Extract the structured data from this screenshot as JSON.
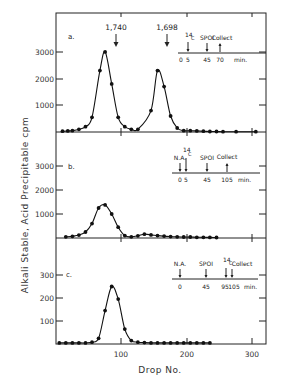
{
  "chart_data": [
    {
      "type": "line",
      "panel": "a.",
      "xlabel": "Drop No.",
      "ylabel": "Alkali Stable, Acid Precipitable cpm",
      "xlim": [
        0,
        320
      ],
      "ylim": [
        0,
        4000
      ],
      "yticks": [
        1000,
        2000,
        3000
      ],
      "xticks": [
        100,
        200,
        300
      ],
      "peak_labels": [
        {
          "x": 75,
          "label": "1,740"
        },
        {
          "x": 155,
          "label": "1,698"
        }
      ],
      "timeline": {
        "events": [
          {
            "t": 5,
            "label": "14C"
          },
          {
            "t": 45,
            "label": "SPOI"
          },
          {
            "t": 70,
            "label": "Collect"
          }
        ],
        "ticks": [
          "0",
          "5",
          "45",
          "70"
        ],
        "unit": "min."
      },
      "x": [
        10,
        18,
        25,
        35,
        45,
        55,
        67,
        75,
        85,
        95,
        105,
        115,
        125,
        145,
        155,
        165,
        175,
        185,
        195,
        205,
        215,
        225,
        235,
        245,
        255,
        275,
        305
      ],
      "values": [
        30,
        40,
        50,
        100,
        200,
        550,
        2300,
        3000,
        1800,
        550,
        200,
        100,
        100,
        800,
        2300,
        1700,
        600,
        150,
        50,
        50,
        40,
        30,
        20,
        20,
        10,
        10,
        10
      ]
    },
    {
      "type": "line",
      "panel": "b.",
      "xlim": [
        0,
        320
      ],
      "ylim": [
        0,
        4000
      ],
      "yticks": [
        1000,
        2000,
        3000
      ],
      "xticks": [
        100,
        200,
        300
      ],
      "timeline": {
        "events": [
          {
            "t": 0,
            "label": "N.A."
          },
          {
            "t": 5,
            "label": "14C"
          },
          {
            "t": 45,
            "label": "SPOI"
          },
          {
            "t": 105,
            "label": "Collect"
          }
        ],
        "ticks": [
          "0",
          "5",
          "45",
          "105"
        ],
        "unit": "min."
      },
      "x": [
        15,
        25,
        35,
        45,
        55,
        65,
        75,
        85,
        95,
        105,
        115,
        125,
        135,
        145,
        155,
        165,
        175,
        185,
        195,
        205,
        215,
        225,
        235,
        245
      ],
      "values": [
        50,
        70,
        120,
        250,
        600,
        1250,
        1380,
        1000,
        450,
        100,
        50,
        90,
        160,
        130,
        100,
        80,
        60,
        50,
        40,
        40,
        30,
        30,
        25,
        20
      ]
    },
    {
      "type": "line",
      "panel": "c.",
      "xlabel": "Drop No.",
      "xlim": [
        0,
        320
      ],
      "ylim": [
        0,
        400
      ],
      "yticks": [
        100,
        200,
        300
      ],
      "xticks": [
        100,
        200,
        300
      ],
      "timeline": {
        "events": [
          {
            "t": 0,
            "label": "N.A."
          },
          {
            "t": 45,
            "label": "SPOI"
          },
          {
            "t": 95,
            "label": "14C"
          },
          {
            "t": 105,
            "label": "Collect"
          }
        ],
        "ticks": [
          "0",
          "45",
          "95",
          "105"
        ],
        "unit": "min."
      },
      "x": [
        5,
        15,
        25,
        35,
        45,
        55,
        65,
        75,
        85,
        95,
        105,
        115,
        125,
        135,
        145,
        155,
        165,
        175,
        185,
        195,
        205,
        215,
        225,
        235
      ],
      "values": [
        5,
        5,
        5,
        5,
        5,
        8,
        25,
        145,
        250,
        195,
        65,
        15,
        8,
        6,
        5,
        5,
        5,
        5,
        5,
        5,
        5,
        5,
        5,
        5
      ]
    }
  ],
  "labels": {
    "ylabel": "Alkali Stable, Acid Precipitable cpm",
    "xlabel": "Drop No.",
    "x_ticks": [
      "100",
      "200",
      "300"
    ],
    "panel_a": {
      "tag": "a.",
      "yticks": [
        "1000",
        "2000",
        "3000"
      ],
      "peak1": "1,740",
      "peak2": "1,698",
      "inset_top": [
        "14",
        "C",
        "SPOI",
        "Collect"
      ],
      "inset_bottom": [
        "0",
        "5",
        "45",
        "70",
        "min."
      ]
    },
    "panel_b": {
      "tag": "b.",
      "yticks": [
        "1000",
        "2000",
        "3000"
      ],
      "inset_top": [
        "N.A.",
        "14",
        "C",
        "SPOI",
        "Collect"
      ],
      "inset_bottom": [
        "0",
        "5",
        "45",
        "105",
        "min."
      ]
    },
    "panel_c": {
      "tag": "c.",
      "yticks": [
        "100",
        "200",
        "300"
      ],
      "inset_top": [
        "N.A.",
        "SPOI",
        "14",
        "C",
        "Collect"
      ],
      "inset_bottom": [
        "0",
        "45",
        "95",
        "105",
        "min."
      ]
    }
  }
}
